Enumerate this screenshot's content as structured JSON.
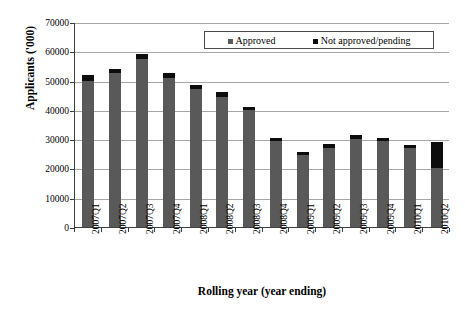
{
  "chart_data": {
    "type": "bar",
    "subtype": "stacked",
    "title": "",
    "xlabel": "Rolling year (year ending)",
    "ylabel": "Applicants ('000)",
    "ylim": [
      0,
      70000
    ],
    "ytick_values": [
      0,
      10000,
      20000,
      30000,
      40000,
      50000,
      60000,
      70000
    ],
    "ytick_labels": [
      "0",
      "10000",
      "20000",
      "30000",
      "40000",
      "50000",
      "60000",
      "70000"
    ],
    "grid": true,
    "legend_position": "top-right-inside",
    "categories": [
      "2007Q1",
      "2007Q2",
      "2007Q3",
      "2007Q4",
      "2008Q1",
      "2008Q2",
      "2008Q3",
      "2008Q4",
      "2009Q1",
      "2009Q2",
      "2009Q3",
      "2009Q4",
      "2010Q1",
      "2010Q2"
    ],
    "series": [
      {
        "name": "Approved",
        "color": "#595959",
        "values": [
          50000,
          52500,
          57500,
          51000,
          47000,
          44500,
          40000,
          29500,
          24500,
          27000,
          30000,
          29500,
          27000,
          20000
        ]
      },
      {
        "name": "Not approved/pending",
        "color": "#0d0d0d",
        "values": [
          2000,
          1500,
          1500,
          1500,
          1500,
          1500,
          1000,
          1000,
          1000,
          1500,
          1500,
          1000,
          1000,
          9000
        ]
      }
    ],
    "totals": [
      52000,
      54000,
      59000,
      52500,
      48500,
      46000,
      41000,
      30500,
      25500,
      28500,
      31500,
      30500,
      28000,
      29000
    ]
  },
  "legend": {
    "items": [
      {
        "label": "Approved",
        "color": "#595959"
      },
      {
        "label": "Not approved/pending",
        "color": "#0d0d0d"
      }
    ]
  },
  "colors": {
    "approved": "#595959",
    "not_approved": "#0d0d0d",
    "gridline": "#a6a6a6",
    "axis": "#3f3f3f",
    "background": "#ffffff"
  }
}
